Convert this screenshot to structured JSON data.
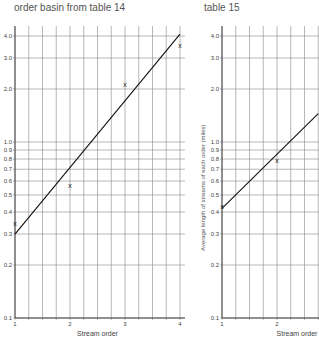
{
  "captions": {
    "left": "order basin from table 14",
    "right": "table 15"
  },
  "chart_data": [
    {
      "type": "scatter",
      "title": "order basin from table 14",
      "xlabel": "Stream order",
      "ylabel": "",
      "yscale": "log",
      "xlim": [
        1,
        4
      ],
      "ylim": [
        0.1,
        4.0
      ],
      "x_ticks": [
        "1",
        "2",
        "3",
        "4"
      ],
      "y_ticks": [
        "0.1",
        "0.2",
        "0.3",
        "0.4",
        "0.5",
        "0.6",
        "0.7",
        "0.8",
        "0.9",
        "1.0",
        "2.0",
        "3.0",
        "4.0"
      ],
      "grid": true,
      "marker": "x",
      "points": [
        {
          "x": 1,
          "y": 0.34
        },
        {
          "x": 2,
          "y": 0.56
        },
        {
          "x": 3,
          "y": 2.1
        },
        {
          "x": 4,
          "y": 3.5
        }
      ],
      "fit_line": {
        "x": [
          1,
          4
        ],
        "y": [
          0.3,
          4.1
        ]
      }
    },
    {
      "type": "scatter",
      "title": "table 15",
      "xlabel": "Stream order",
      "ylabel": "Average length of streams of each order (miles)",
      "yscale": "log",
      "xlim": [
        1,
        2.75
      ],
      "ylim": [
        0.1,
        4.0
      ],
      "x_ticks": [
        "1",
        "2"
      ],
      "y_ticks": [
        "0.1",
        "0.2",
        "0.3",
        "0.4",
        "0.5",
        "0.6",
        "0.7",
        "0.8",
        "0.9",
        "1.0",
        "2.0",
        "3.0",
        "4.0"
      ],
      "grid": true,
      "marker": "x",
      "points": [
        {
          "x": 1,
          "y": 0.43
        },
        {
          "x": 2,
          "y": 0.78
        }
      ],
      "fit_line": {
        "x": [
          1,
          2.75
        ],
        "y": [
          0.42,
          1.45
        ]
      }
    }
  ]
}
